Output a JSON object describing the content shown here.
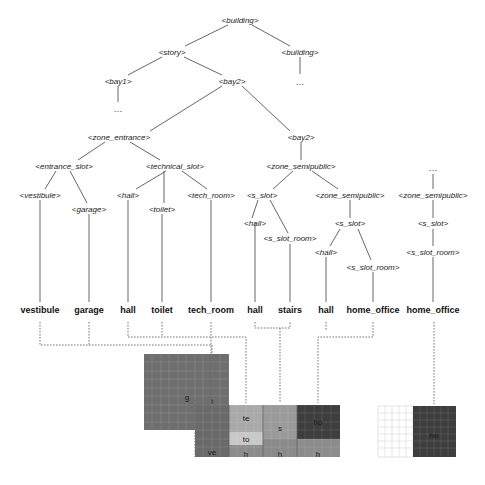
{
  "tree": {
    "root": "<building>",
    "level1": {
      "story": "<story>",
      "building_right": "<building>"
    },
    "level2": {
      "bay1": "<bay1>",
      "bay2": "<bay2>",
      "ellipsis_building": "…"
    },
    "level3": {
      "ellipsis_bay1": "…",
      "zone_entrance": "<zone_entrance>",
      "bay2_child": "<bay2>"
    },
    "level4": {
      "entrance_slot": "<entrance_slot>",
      "technical_slot": "<technical_slot>",
      "zone_semipublic": "<zone_semipublic>",
      "ellipsis_right": "…"
    },
    "level5": {
      "vestibule": "<vestibule>",
      "garage": "<garage>",
      "hall_tech": "<hall>",
      "toilet": "<toilet>",
      "tech_room": "<tech_room>",
      "s_slot_a": "<s_slot>",
      "zone_semipublic_b": "<zone_semipublic>",
      "zone_semipublic_c": "<zone_semipublic>"
    },
    "level6": {
      "hall_s": "<hall>",
      "s_slot_room_a": "<s_slot_room>",
      "s_slot_b": "<s_slot>",
      "s_slot_c": "<s_slot>",
      "hall_b": "<hall>",
      "s_slot_room_b": "<s_slot_room>",
      "s_slot_room_c": "<s_slot_room>"
    },
    "leaves": [
      "vestibule",
      "garage",
      "hall",
      "toilet",
      "tech_room",
      "hall",
      "stairs",
      "hall",
      "home_office",
      "home_office"
    ]
  },
  "floorplan": {
    "rooms": {
      "garage": "g",
      "vestibule": "ve",
      "tech_room": "te",
      "toilet": "to",
      "hall_1": "h",
      "stairs": "s",
      "hall_2": "h",
      "home_office_1": "ho",
      "hall_3": "h",
      "home_office_2": "ho",
      "tech_room_marker": "t"
    },
    "colors": {
      "garage": "#6e6e6e",
      "vestibule": "#6a6a6a",
      "tech_room": "#a9a9a9",
      "toilet": "#c8c8c8",
      "hall": "#8c8c8c",
      "stairs": "#9a9a9a",
      "home_office": "#3e3e3e",
      "empty": "#ffffff"
    }
  }
}
